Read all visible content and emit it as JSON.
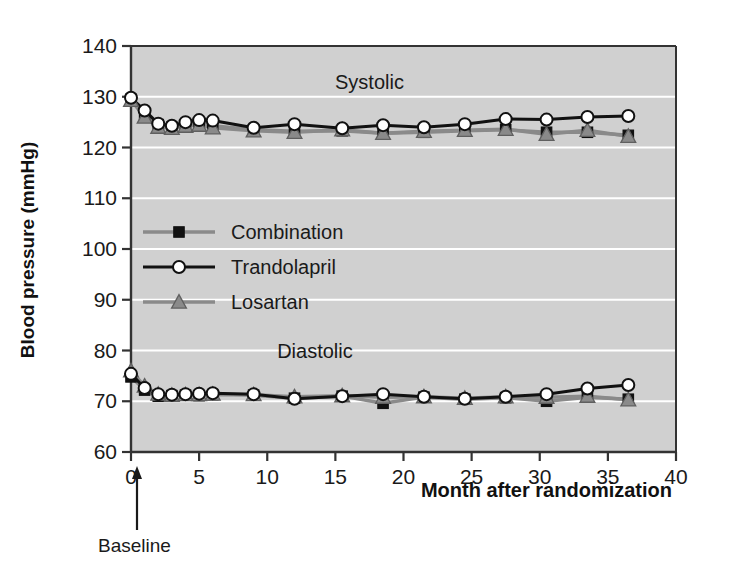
{
  "chart_data": {
    "type": "line",
    "title": "",
    "xlabel": "Month after randomization",
    "ylabel": "Blood pressure (mmHg)",
    "xlim": [
      0,
      40
    ],
    "ylim": [
      60,
      140
    ],
    "xticks": [
      0,
      5,
      10,
      15,
      20,
      25,
      30,
      35,
      40
    ],
    "yticks": [
      60,
      70,
      80,
      90,
      100,
      110,
      120,
      130,
      140
    ],
    "grid": "horizontal-white",
    "plot_background": "#d0d0d0",
    "legend_position": "center-left",
    "annotations": [
      {
        "text": "Systolic",
        "x": 17.5,
        "y": 131.5
      },
      {
        "text": "Diastolic",
        "x": 13.5,
        "y": 78.5
      },
      {
        "text": "Baseline",
        "x": 0,
        "y": 55,
        "arrow": true
      }
    ],
    "groups": [
      {
        "name": "Systolic",
        "series": [
          {
            "name": "Combination",
            "color": "#8a8a8a",
            "marker": "square",
            "marker_color": "#111111",
            "x": [
              0,
              1,
              2,
              3,
              4,
              5,
              6,
              9,
              12,
              15.5,
              18.5,
              21.5,
              24.5,
              27.5,
              30.5,
              33.5,
              36.5
            ],
            "y": [
              129.5,
              126.5,
              124.5,
              124.0,
              124.5,
              124.8,
              124.3,
              123.5,
              123.2,
              123.3,
              122.8,
              123.0,
              123.3,
              123.5,
              123.0,
              123.0,
              122.4
            ]
          },
          {
            "name": "Trandolapril",
            "color": "#111111",
            "marker": "circle",
            "marker_color": "#ffffff",
            "x": [
              0,
              1,
              2,
              3,
              4,
              5,
              6,
              9,
              12,
              15.5,
              18.5,
              21.5,
              24.5,
              27.5,
              30.5,
              33.5,
              36.5
            ],
            "y": [
              129.8,
              127.3,
              124.7,
              124.3,
              125.0,
              125.4,
              125.3,
              123.9,
              124.6,
              123.8,
              124.4,
              124.0,
              124.6,
              125.6,
              125.5,
              126.0,
              126.2
            ]
          },
          {
            "name": "Losartan",
            "color": "#8a8a8a",
            "marker": "triangle",
            "marker_color": "#8a8a8a",
            "x": [
              0,
              1,
              2,
              3,
              4,
              5,
              6,
              9,
              12,
              15.5,
              18.5,
              21.5,
              24.5,
              27.5,
              30.5,
              33.5,
              36.5
            ],
            "y": [
              129.3,
              126.0,
              124.0,
              123.8,
              124.2,
              124.4,
              123.9,
              123.3,
              123.0,
              123.5,
              122.8,
              123.2,
              123.4,
              123.6,
              122.6,
              123.4,
              122.2
            ]
          }
        ]
      },
      {
        "name": "Diastolic",
        "series": [
          {
            "name": "Combination",
            "color": "#8a8a8a",
            "marker": "square",
            "marker_color": "#111111",
            "x": [
              0,
              1,
              2,
              3,
              4,
              5,
              6,
              9,
              12,
              15.5,
              18.5,
              21.5,
              24.5,
              27.5,
              30.5,
              33.5,
              36.5
            ],
            "y": [
              74.8,
              72.2,
              71.0,
              71.1,
              71.2,
              71.1,
              71.3,
              71.2,
              70.6,
              71.0,
              69.6,
              70.8,
              70.4,
              70.7,
              70.0,
              70.8,
              70.4
            ]
          },
          {
            "name": "Trandolapril",
            "color": "#111111",
            "marker": "circle",
            "marker_color": "#ffffff",
            "x": [
              0,
              1,
              2,
              3,
              4,
              5,
              6,
              9,
              12,
              15.5,
              18.5,
              21.5,
              24.5,
              27.5,
              30.5,
              33.5,
              36.5
            ],
            "y": [
              75.4,
              72.6,
              71.4,
              71.3,
              71.4,
              71.5,
              71.6,
              71.4,
              70.5,
              71.0,
              71.4,
              70.9,
              70.5,
              70.9,
              71.4,
              72.5,
              73.2
            ]
          },
          {
            "name": "Losartan",
            "color": "#8a8a8a",
            "marker": "triangle",
            "marker_color": "#8a8a8a",
            "x": [
              0,
              1,
              2,
              3,
              4,
              5,
              6,
              9,
              12,
              15.5,
              18.5,
              21.5,
              24.5,
              27.5,
              30.5,
              33.5,
              36.5
            ],
            "y": [
              76.0,
              73.0,
              71.4,
              71.2,
              71.3,
              71.3,
              71.4,
              71.3,
              70.9,
              71.1,
              70.8,
              70.9,
              70.6,
              70.9,
              70.8,
              71.0,
              70.3
            ]
          }
        ]
      }
    ],
    "legend": [
      {
        "label": "Combination",
        "color": "#8a8a8a",
        "marker": "square",
        "marker_color": "#111111"
      },
      {
        "label": "Trandolapril",
        "color": "#111111",
        "marker": "circle",
        "marker_color": "#ffffff"
      },
      {
        "label": "Losartan",
        "color": "#8a8a8a",
        "marker": "triangle",
        "marker_color": "#8a8a8a"
      }
    ]
  },
  "labels": {
    "systolic": "Systolic",
    "diastolic": "Diastolic",
    "baseline": "Baseline",
    "xlabel": "Month after randomization",
    "ylabel": "Blood pressure (mmHg)"
  }
}
